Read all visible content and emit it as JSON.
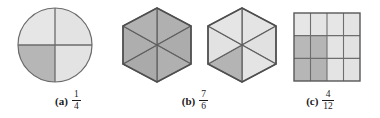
{
  "figure": {
    "type": "fraction-models-illustration",
    "background": "#ffffff",
    "colors": {
      "shaded_fill": "#b4b4b4",
      "unshaded_fill": "#e0e0e0",
      "stroke": "#5a5a5a",
      "text": "#1a1a1a"
    },
    "parts": [
      {
        "key": "a",
        "label": "(a)",
        "fraction": {
          "numerator": "1",
          "denominator": "4"
        },
        "shape": "circle",
        "total_parts": 4,
        "shaded_parts": 1,
        "shaded_regions": [
          "bottom-left-quadrant"
        ]
      },
      {
        "key": "b",
        "label": "(b)",
        "fraction": {
          "numerator": "7",
          "denominator": "6"
        },
        "shape": "hexagon-pair",
        "total_parts": 6,
        "shaded_parts": 7,
        "shaded_regions": [
          "hexagon-1-all-six-triangles",
          "hexagon-2-lower-left-triangle"
        ]
      },
      {
        "key": "c",
        "label": "(c)",
        "fraction": {
          "numerator": "4",
          "denominator": "12"
        },
        "shape": "rectangle-grid",
        "grid": {
          "columns": 4,
          "rows": 3
        },
        "total_parts": 12,
        "shaded_parts": 4,
        "shaded_regions": [
          "row2-col1",
          "row2-col2",
          "row3-col1",
          "row3-col2"
        ]
      }
    ]
  }
}
